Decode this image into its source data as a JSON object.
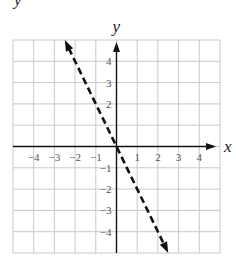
{
  "chart_data": {
    "type": "line",
    "title": "",
    "xlabel": "x",
    "ylabel": "y",
    "xlim": [
      -5,
      5
    ],
    "ylim": [
      -5,
      5
    ],
    "grid": true,
    "x_ticks": [
      "-4",
      "-3",
      "-2",
      "-1",
      "1",
      "2",
      "3",
      "4"
    ],
    "y_ticks": [
      "4",
      "3",
      "2",
      "-1",
      "-2",
      "-3",
      "-4"
    ],
    "series": [
      {
        "name": "y = -2x",
        "style": "dashed",
        "arrows": "both",
        "equation": "y = -2x",
        "x": [
          -2.5,
          2.5
        ],
        "y": [
          5,
          -5
        ]
      }
    ],
    "legend": null
  },
  "top_fragment": "y"
}
